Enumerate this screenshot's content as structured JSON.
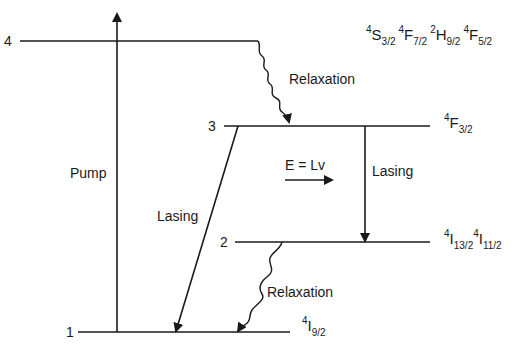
{
  "diagram": {
    "type": "energy-level-diagram",
    "levels": [
      {
        "id": "1",
        "label": "1",
        "term": {
          "sup": "4",
          "sym": "I",
          "sub": "9/2"
        }
      },
      {
        "id": "2",
        "label": "2",
        "terms": [
          {
            "sup": "4",
            "sym": "I",
            "sub": "13/2"
          },
          {
            "sup": "4",
            "sym": "I",
            "sub": "11/2"
          }
        ]
      },
      {
        "id": "3",
        "label": "3",
        "term": {
          "sup": "4",
          "sym": "F",
          "sub": "3/2"
        }
      },
      {
        "id": "4",
        "label": "4",
        "terms": [
          {
            "sup": "4",
            "sym": "S",
            "sub": "3/2"
          },
          {
            "sup": "4",
            "sym": "F",
            "sub": "7/2"
          },
          {
            "sup": "2",
            "sym": "H",
            "sub": "9/2"
          },
          {
            "sup": "4",
            "sym": "F",
            "sub": "5/2"
          }
        ]
      }
    ],
    "transitions": {
      "pump": {
        "label": "Pump",
        "from": "1",
        "to": "4"
      },
      "relaxation_upper": {
        "label": "Relaxation",
        "from": "4",
        "to": "3"
      },
      "lasing_vertical": {
        "label": "Lasing",
        "from": "3",
        "to": "2"
      },
      "lasing_diagonal": {
        "label": "Lasing",
        "from": "3",
        "to": "1"
      },
      "relaxation_lower": {
        "label": "Relaxation",
        "from": "2",
        "to": "1"
      }
    },
    "energy_annotation": "E = Lv"
  }
}
